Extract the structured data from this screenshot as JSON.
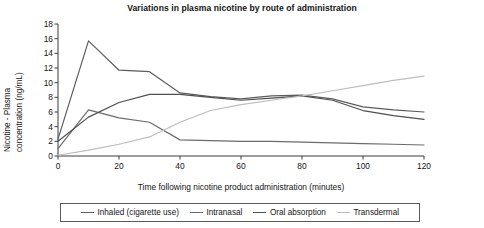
{
  "chart_data": {
    "type": "line",
    "title": "Variations in plasma nicotine by route of administration",
    "xlabel": "Time following nicotine product administration (minutes)",
    "ylabel": "Nicotine - Plasma concentration (ng/mL)",
    "ylabel_line1": "Nicotine - Plasma",
    "ylabel_line2": "concentration (ng/mL)",
    "xlim": [
      0,
      120
    ],
    "ylim": [
      0,
      18
    ],
    "xticks": [
      0,
      20,
      40,
      60,
      80,
      100,
      120
    ],
    "yticks": [
      0,
      2,
      4,
      6,
      8,
      10,
      12,
      14,
      16,
      18
    ],
    "grid": false,
    "legend_position": "below-center",
    "x": [
      0,
      10,
      20,
      30,
      40,
      50,
      60,
      70,
      80,
      90,
      100,
      110,
      120
    ],
    "series": [
      {
        "name": "Inhaled (cigarette use)",
        "color": "#5c5c5c",
        "values": [
          2.3,
          15.7,
          11.7,
          11.5,
          8.6,
          8.1,
          7.8,
          8.2,
          8.3,
          7.8,
          6.7,
          6.3,
          6.0
        ]
      },
      {
        "name": "Intranasal",
        "color": "#6b6b6b",
        "values": [
          1.0,
          6.3,
          5.2,
          4.6,
          2.2,
          2.1,
          2.0,
          2.0,
          1.9,
          1.8,
          1.7,
          1.6,
          1.5
        ]
      },
      {
        "name": "Oral absorption",
        "color": "#4f4f4f",
        "values": [
          2.0,
          5.3,
          7.3,
          8.4,
          8.4,
          8.0,
          7.6,
          7.9,
          8.2,
          7.6,
          6.2,
          5.5,
          5.0
        ]
      },
      {
        "name": "Transdermal",
        "color": "#bdbdbd",
        "values": [
          0.1,
          0.8,
          1.6,
          2.6,
          4.6,
          6.2,
          7.0,
          7.6,
          8.2,
          8.9,
          9.6,
          10.3,
          10.9
        ]
      }
    ]
  },
  "legend": {
    "items": [
      {
        "label": "Inhaled (cigarette use)",
        "color": "#5c5c5c"
      },
      {
        "label": "Intranasal",
        "color": "#6b6b6b"
      },
      {
        "label": "Oral absorption",
        "color": "#4f4f4f"
      },
      {
        "label": "Transdermal",
        "color": "#bdbdbd"
      }
    ]
  },
  "axis": {
    "line_color": "#3d3d3d"
  }
}
